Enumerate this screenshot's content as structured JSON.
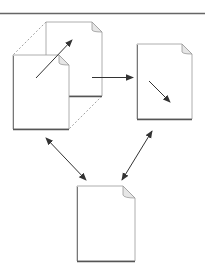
{
  "diagram": {
    "title": "",
    "colors": {
      "background": "#ffffff",
      "page_fill": "#ffffff",
      "page_border": "#9a9a9a",
      "page_shadow": "#555555",
      "fold": "#e6e6e6",
      "arrow": "#333333",
      "dashed": "#8a8a8a",
      "top_rule": "#666666"
    },
    "nodes": [
      {
        "id": "stack-back-page",
        "label": "",
        "x": 46,
        "y": 22,
        "w": 56,
        "h": 74
      },
      {
        "id": "stack-front-page",
        "label": "",
        "x": 13,
        "y": 55,
        "w": 56,
        "h": 74
      },
      {
        "id": "right-page",
        "label": "",
        "x": 137,
        "y": 44,
        "w": 55,
        "h": 75
      },
      {
        "id": "bottom-page",
        "label": "",
        "x": 77,
        "y": 186,
        "w": 58,
        "h": 75
      }
    ],
    "edges": [
      {
        "from": "stack",
        "to": "right-page",
        "type": "single-arrow"
      },
      {
        "from": "stack",
        "to": "bottom-page",
        "type": "double-arrow"
      },
      {
        "from": "right-page",
        "to": "bottom-page",
        "type": "double-arrow"
      }
    ],
    "inner_arrows": [
      {
        "in": "stack",
        "direction": "up-right"
      },
      {
        "in": "right-page",
        "direction": "down-right"
      }
    ]
  }
}
